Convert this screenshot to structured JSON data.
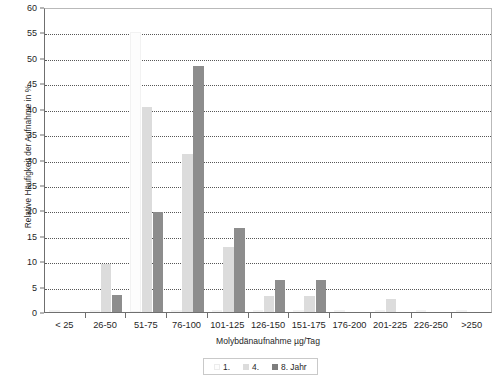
{
  "chart_data": {
    "type": "bar",
    "title": "",
    "subtitle": "",
    "xlabel": "Molybdänaufnahme µg/Tag",
    "ylabel": "Relative Häufigkeit der Aufnahme in %",
    "categories": [
      "< 25",
      "26-50",
      "51-75",
      "76-100",
      "101-125",
      "126-150",
      "151-175",
      "176-200",
      "201-225",
      "226-250",
      ">250"
    ],
    "series": [
      {
        "name": "1.",
        "color": "#fdfdfd",
        "values": [
          0,
          0,
          55,
          0,
          0,
          0,
          0,
          0,
          0,
          0,
          0
        ]
      },
      {
        "name": "4.",
        "color": "#dcdcdc",
        "values": [
          0,
          9.4,
          40.3,
          31,
          12.8,
          3.1,
          3.1,
          0,
          2.5,
          0,
          0
        ]
      },
      {
        "name": "8. Jahr",
        "color": "#8d8d8d",
        "values": [
          0,
          3.3,
          19.6,
          48.4,
          16.6,
          6.3,
          6.3,
          0,
          0,
          0,
          0
        ]
      }
    ],
    "ylim": [
      0,
      60
    ],
    "yticks": [
      0,
      5,
      10,
      15,
      20,
      25,
      30,
      35,
      40,
      45,
      50,
      55,
      60
    ],
    "grid": true,
    "grid_style": "dotted-horizontal",
    "legend_position": "bottom-center",
    "legend_entries": [
      "1.",
      "4.",
      "8. Jahr"
    ]
  }
}
